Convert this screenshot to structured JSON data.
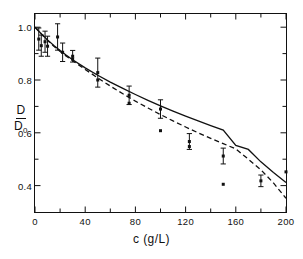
{
  "chart_data": {
    "type": "line",
    "title": "",
    "xlabel": "c (g/L)",
    "ylabel": "D/D0",
    "ylabel_numerator": "D",
    "ylabel_denominator": "D",
    "ylabel_denominator_sub": "0",
    "xlim": [
      0,
      200
    ],
    "ylim": [
      0.3,
      1.05
    ],
    "grid": false,
    "legend": null,
    "xticks": [
      0,
      40,
      80,
      120,
      160,
      200
    ],
    "xticklabels": [
      "0",
      "40",
      "80",
      "120",
      "160",
      "200"
    ],
    "yticks": [
      0.4,
      0.6,
      0.8,
      1.0
    ],
    "yticklabels": [
      "0.4",
      "0.6",
      "0.8",
      "1.0"
    ],
    "xminorticks": [
      20,
      60,
      100,
      140,
      180
    ],
    "yminorticks": [
      0.5,
      0.7,
      0.9
    ],
    "series": [
      {
        "name": "solid-curve",
        "style": "solid",
        "color": "#111111",
        "x": [
          0,
          5,
          10,
          15,
          20,
          25,
          30,
          40,
          50,
          60,
          70,
          80,
          90,
          100,
          110,
          120,
          130,
          140,
          150,
          160,
          170,
          180,
          190,
          200
        ],
        "y": [
          1.0,
          0.975,
          0.952,
          0.931,
          0.912,
          0.894,
          0.877,
          0.846,
          0.818,
          0.792,
          0.768,
          0.745,
          0.723,
          0.702,
          0.682,
          0.663,
          0.645,
          0.627,
          0.61,
          0.552,
          0.537,
          0.49,
          0.45,
          0.412
        ]
      },
      {
        "name": "dashed-curve",
        "style": "dashed",
        "color": "#111111",
        "x": [
          0,
          5,
          10,
          15,
          20,
          25,
          30,
          40,
          50,
          60,
          70,
          80,
          90,
          100,
          110,
          120,
          130,
          140,
          150,
          160,
          170,
          180,
          190,
          200
        ],
        "y": [
          1.0,
          0.974,
          0.95,
          0.928,
          0.908,
          0.89,
          0.873,
          0.84,
          0.808,
          0.777,
          0.748,
          0.72,
          0.694,
          0.669,
          0.645,
          0.622,
          0.6,
          0.579,
          0.559,
          0.539,
          0.5,
          0.46,
          0.41,
          0.352
        ]
      }
    ],
    "points_with_errorbars": [
      {
        "x": 3,
        "y": 0.955,
        "yerr": 0.042
      },
      {
        "x": 5,
        "y": 0.93,
        "yerr": 0.04
      },
      {
        "x": 8,
        "y": 0.945,
        "yerr": 0.04
      },
      {
        "x": 10,
        "y": 0.928,
        "yerr": 0.038
      },
      {
        "x": 18,
        "y": 0.963,
        "yerr": 0.05
      },
      {
        "x": 22,
        "y": 0.905,
        "yerr": 0.035
      },
      {
        "x": 30,
        "y": 0.89,
        "yerr": 0.022
      },
      {
        "x": 50,
        "y": 0.828,
        "yerr": 0.055
      },
      {
        "x": 75,
        "y": 0.742,
        "yerr": 0.035
      },
      {
        "x": 100,
        "y": 0.69,
        "yerr": 0.035
      },
      {
        "x": 123,
        "y": 0.567,
        "yerr": 0.03
      },
      {
        "x": 150,
        "y": 0.512,
        "yerr": 0.03
      },
      {
        "x": 180,
        "y": 0.418,
        "yerr": 0.022
      }
    ],
    "points_plain": [
      {
        "x": 30,
        "y": 0.88
      },
      {
        "x": 50,
        "y": 0.8
      },
      {
        "x": 75,
        "y": 0.712
      },
      {
        "x": 100,
        "y": 0.608
      },
      {
        "x": 123,
        "y": 0.548
      },
      {
        "x": 150,
        "y": 0.405
      },
      {
        "x": 200,
        "y": 0.452
      }
    ]
  }
}
